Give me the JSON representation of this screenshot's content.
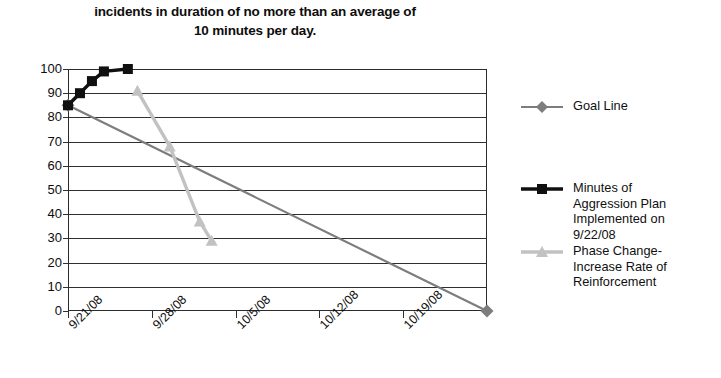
{
  "title": {
    "line1": "incidents in duration of no more than an average of",
    "line2": "10 minutes per day."
  },
  "chart_data": {
    "type": "line",
    "title": "incidents in duration of no more than an average of 10 minutes per day.",
    "xlabel": "",
    "ylabel": "",
    "ylim": [
      0,
      100
    ],
    "ytick_values": [
      0,
      10,
      20,
      30,
      40,
      50,
      60,
      70,
      80,
      90,
      100
    ],
    "ytick_labels": [
      "0",
      "10",
      "20",
      "30",
      "40",
      "50",
      "60",
      "70",
      "80",
      "90",
      "100"
    ],
    "xtick_labels": [
      "9/21/08",
      "9/28/08",
      "10/5/08",
      "10/12/08",
      "10/19/08"
    ],
    "xtick_days": [
      0,
      7,
      14,
      21,
      28
    ],
    "x_axis_days_total": 35,
    "grid": true,
    "grid_axis": "y",
    "legend_position": "right",
    "series": [
      {
        "name": "Goal Line",
        "color": "#7d7d7d",
        "marker": "diamond",
        "x_days": [
          0,
          35
        ],
        "values": [
          85,
          0
        ]
      },
      {
        "name": "Minutes of Aggression Plan Implemented on 9/22/08",
        "color": "#101010",
        "marker": "square",
        "x_days": [
          0,
          1,
          2,
          3,
          5
        ],
        "values": [
          85,
          90,
          95,
          99,
          100
        ]
      },
      {
        "name": "Phase Change-Increase Rate of Reinforcement",
        "color": "#c2c2c2",
        "marker": "triangle",
        "x_days": [
          5.8,
          8.5,
          11,
          12
        ],
        "values": [
          91,
          68,
          37,
          29
        ]
      }
    ]
  },
  "legend": {
    "entries": [
      {
        "label": "Goal Line",
        "color": "#7d7d7d",
        "marker": "diamond-marker-icon",
        "top": 10
      },
      {
        "label": "Minutes of\nAggression Plan\nImplemented on\n9/22/08",
        "color": "#101010",
        "marker": "square-marker-icon",
        "top": 92
      },
      {
        "label": "Phase Change-\nIncrease Rate of\nReinforcement",
        "color": "#c2c2c2",
        "marker": "triangle-marker-icon",
        "top": 155
      }
    ]
  },
  "colors": {
    "axis": "#2f2f2f",
    "goal_line": "#7d7d7d",
    "black_series": "#101010",
    "gray_series": "#c2c2c2",
    "background": "#ffffff"
  }
}
